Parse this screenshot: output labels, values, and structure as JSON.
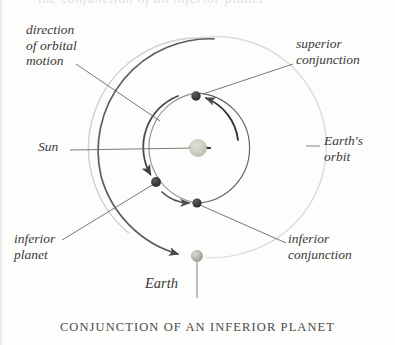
{
  "figure": {
    "caption": "CONJUNCTION OF AN INFERIOR PLANET",
    "top_cut_text": "the conjunction of an inferior planet",
    "background_color": "#fdfdfc"
  },
  "labels": {
    "direction_of_orbital_motion": "direction\nof orbital\nmotion",
    "superior_conjunction": "superior\nconjunction",
    "sun": "Sun",
    "earths_orbit": "Earth's\norbit",
    "inferior_planet": "inferior\nplanet",
    "inferior_conjunction": "inferior\nconjunction",
    "earth": "Earth"
  },
  "bodies": [
    {
      "name": "sun",
      "label": "Sun",
      "cx": 198,
      "cy": 148,
      "r": 8.5,
      "color": "#c9c9bd",
      "kind": "star"
    },
    {
      "name": "planet-superior-conjunction",
      "label": "superior conjunction",
      "cx": 196,
      "cy": 96,
      "r": 4.6,
      "color": "#3b3b3b",
      "kind": "planet"
    },
    {
      "name": "planet-inferior",
      "label": "inferior planet",
      "cx": 156,
      "cy": 182,
      "r": 4.8,
      "color": "#3b3b3b",
      "kind": "planet"
    },
    {
      "name": "planet-inferior-conjunction",
      "label": "inferior conjunction",
      "cx": 197,
      "cy": 203,
      "r": 4.5,
      "color": "#3b3b3b",
      "kind": "planet"
    },
    {
      "name": "earth",
      "label": "Earth",
      "cx": 197,
      "cy": 256,
      "r": 5.6,
      "color": "#b4b4ac",
      "kind": "planet"
    }
  ],
  "orbits": [
    {
      "name": "earths-orbit",
      "cx": 198,
      "cy": 148,
      "r": 110,
      "color": "#d6d6d6",
      "width": 1.3
    },
    {
      "name": "inferior-planet-orbit",
      "cx": 198,
      "cy": 148,
      "r": 55,
      "color": "#6e6e6e",
      "width": 1.1
    }
  ],
  "colors": {
    "ink": "#3a3a3a",
    "leader_line": "#6b6b6b",
    "outer_orbit": "#d6d6d6",
    "inner_orbit": "#6e6e6e",
    "motion_arc": "#5a5a5a",
    "sun_fill": "#c9c9bd",
    "planet_fill": "#3b3b3b",
    "earth_fill": "#b4b4ac"
  },
  "label_positions": {
    "direction_of_orbital_motion": {
      "left": 26,
      "top": 22
    },
    "superior_conjunction": {
      "left": 296,
      "top": 36
    },
    "sun": {
      "left": 38,
      "top": 139
    },
    "earths_orbit": {
      "left": 324,
      "top": 133
    },
    "inferior_planet": {
      "left": 14,
      "top": 231
    },
    "inferior_conjunction": {
      "left": 288,
      "top": 231
    },
    "earth": {
      "left": 145,
      "top": 276
    }
  }
}
